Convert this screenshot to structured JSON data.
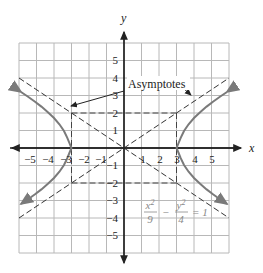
{
  "diagram": {
    "type": "hyperbola",
    "equation": {
      "x_num": "x",
      "x_exp": "2",
      "x_den": "9",
      "minus": "−",
      "y_num": "y",
      "y_exp": "2",
      "y_den": "4",
      "rhs": "= 1"
    },
    "a": 3,
    "b": 2,
    "axes": {
      "x_label": "x",
      "y_label": "y",
      "x_ticks": [
        "−5",
        "−4",
        "−3",
        "−2",
        "−1",
        "1",
        "2",
        "3",
        "4",
        "5"
      ],
      "x_tick_values": [
        -5,
        -4,
        -3,
        -2,
        -1,
        1,
        2,
        3,
        4,
        5
      ],
      "y_ticks": [
        "5",
        "4",
        "3",
        "2",
        "1",
        "−1",
        "−2",
        "−3",
        "−4",
        "−5"
      ],
      "y_tick_values": [
        5,
        4,
        3,
        2,
        1,
        -1,
        -2,
        -3,
        -4,
        -5
      ],
      "grid_range": [
        -6,
        6
      ]
    },
    "annotation": {
      "label": "Asymptotes"
    },
    "asymptotes": [
      "y = 2x/3",
      "y = -2x/3"
    ],
    "fundamental_rectangle": {
      "x": [
        -3,
        3
      ],
      "y": [
        -2,
        2
      ]
    },
    "colors": {
      "grid": "#b8b8b8",
      "axis": "#222222",
      "curve": "#7a7a7a",
      "asymptote": "#333333",
      "equation": "#888888"
    }
  }
}
